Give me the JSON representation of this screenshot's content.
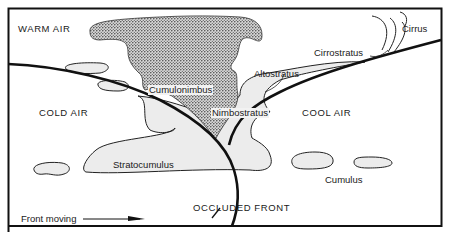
{
  "diagram": {
    "air_masses": {
      "warm": "WARM AIR",
      "cold": "COLD AIR",
      "cool": "COOL AIR"
    },
    "clouds": {
      "cirrus": "Cirrus",
      "cirrostratus": "Cirrostratus",
      "altostratus": "Altostratus",
      "cumulonimbus": "Cumulonimbus",
      "nimbostratus": "Nimbostratus",
      "stratocumulus": "Stratocumulus",
      "cumulus": "Cumulus"
    },
    "front_label": "OCCLUDED FRONT",
    "motion_label": "Front moving",
    "colors": {
      "ink": "#111111",
      "cloud_fill": "#ececec",
      "stipple_dot": "#3a3a3a",
      "background": "#ffffff"
    }
  }
}
